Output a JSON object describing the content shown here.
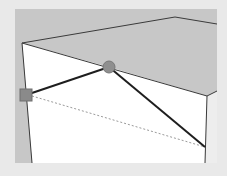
{
  "viewport": {
    "label": "3D modeling viewport",
    "colors": {
      "frame": "#e9e9e9",
      "top_face": "#c7c7c7",
      "front_face": "#ffffff",
      "right_face": "#ededed",
      "edge": "#3a3a3a",
      "drawn_line": "#1e1e1e",
      "inference_dotted": "#9a9a9a",
      "endpoint_handle": "#8a8a8a",
      "midpoint_handle": "#8f8f8f"
    }
  },
  "scene": {
    "box": {
      "top_peak": [
        175,
        17
      ],
      "top_left_corner": [
        22,
        43
      ],
      "front_right_corner": [
        207,
        96
      ],
      "right_back": [
        217,
        91
      ],
      "bottom_left": [
        32,
        163
      ],
      "bottom_right": [
        205,
        163
      ]
    },
    "drawn_lines": [
      {
        "from": [
          26,
          95
        ],
        "to": [
          109,
          67
        ]
      },
      {
        "from": [
          109,
          67
        ],
        "to": [
          205,
          147
        ]
      }
    ],
    "dotted_inference_line": {
      "from": [
        32,
        96
      ],
      "to": [
        205,
        147
      ]
    },
    "handles": [
      {
        "type": "square",
        "role": "endpoint",
        "center": [
          26,
          95
        ],
        "size": 12
      },
      {
        "type": "circle",
        "role": "on-edge",
        "center": [
          109,
          67
        ],
        "radius": 6
      }
    ]
  }
}
